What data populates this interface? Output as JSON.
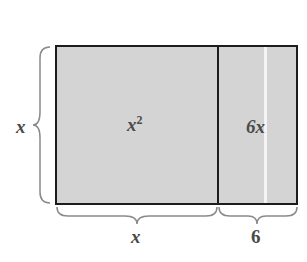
{
  "diagram": {
    "title": "",
    "regions": [
      {
        "id": "square",
        "label_base": "x",
        "label_exp": "2",
        "width_label": "x",
        "height_label": "x"
      },
      {
        "id": "strip",
        "label": "6x",
        "width_label": "6",
        "height_label": "x"
      }
    ],
    "side_labels": {
      "left": "x",
      "bottom_left": "x",
      "bottom_right": "6"
    },
    "colors": {
      "fill": "#d4d4d4",
      "stroke": "#1c1c1c",
      "text": "#4a4a4a",
      "brace": "#8a8a8a"
    }
  }
}
